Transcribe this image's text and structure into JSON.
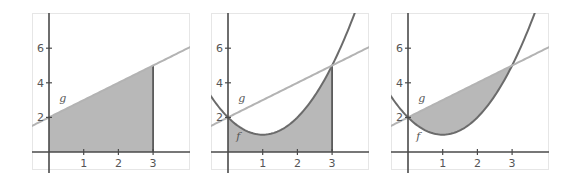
{
  "colors": {
    "frame": "#e6e6e6",
    "axis": "#4a4a4a",
    "fill": "#b8b8b8",
    "f_curve": "#6b6b6b",
    "g_line": "#b3b3b3",
    "text": "#555555"
  },
  "chart_data": [
    {
      "type": "area",
      "title": "",
      "xlabel": "",
      "ylabel": "",
      "xlim": [
        -0.5,
        4
      ],
      "ylim": [
        -1,
        8
      ],
      "x_ticks": [
        1,
        2,
        3
      ],
      "y_ticks": [
        2,
        4,
        6
      ],
      "grid": false,
      "series": [
        {
          "name": "g",
          "expression": "x + 2",
          "style": "light-line"
        }
      ],
      "shaded_region": {
        "between": [
          "g",
          "x-axis"
        ],
        "x_from": 0,
        "x_to": 3
      },
      "annotations": [
        {
          "text": "g",
          "x": 0.4,
          "y": 2.9
        }
      ]
    },
    {
      "type": "area",
      "title": "",
      "xlabel": "",
      "ylabel": "",
      "xlim": [
        -0.5,
        4
      ],
      "ylim": [
        -1,
        8
      ],
      "x_ticks": [
        1,
        2,
        3
      ],
      "y_ticks": [
        2,
        4,
        6
      ],
      "grid": false,
      "series": [
        {
          "name": "f",
          "expression": "x^2 - 2x + 2",
          "style": "dark-curve"
        },
        {
          "name": "g",
          "expression": "x + 2",
          "style": "light-line"
        }
      ],
      "shaded_region": {
        "between": [
          "f",
          "x-axis"
        ],
        "x_from": 0,
        "x_to": 3
      },
      "annotations": [
        {
          "text": "g",
          "x": 0.4,
          "y": 2.9
        },
        {
          "text": "f",
          "x": 0.3,
          "y": 0.7
        }
      ]
    },
    {
      "type": "area",
      "title": "",
      "xlabel": "",
      "ylabel": "",
      "xlim": [
        -0.5,
        4
      ],
      "ylim": [
        -1,
        8
      ],
      "x_ticks": [
        1,
        2,
        3
      ],
      "y_ticks": [
        2,
        4,
        6
      ],
      "grid": false,
      "series": [
        {
          "name": "f",
          "expression": "x^2 - 2x + 2",
          "style": "dark-curve"
        },
        {
          "name": "g",
          "expression": "x + 2",
          "style": "light-line"
        }
      ],
      "shaded_region": {
        "between": [
          "g",
          "f"
        ],
        "x_from": 0,
        "x_to": 3
      },
      "annotations": [
        {
          "text": "g",
          "x": 0.4,
          "y": 2.9
        },
        {
          "text": "f",
          "x": 0.3,
          "y": 0.7
        }
      ]
    }
  ],
  "panels": [
    {
      "left": 32
    },
    {
      "left": 211
    },
    {
      "left": 391
    }
  ]
}
